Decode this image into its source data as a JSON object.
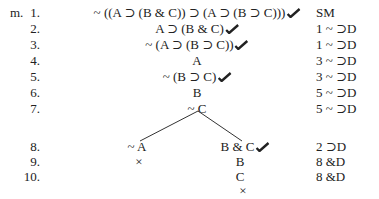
{
  "exercise_label": "m.",
  "rows": [
    {
      "num": "1.",
      "formula": "~ ((A ⊃ (B & C)) ⊃ (A ⊃ (B ⊃ C)))",
      "checked": true,
      "just": "SM"
    },
    {
      "num": "2.",
      "formula": "A ⊃ (B & C)",
      "checked": true,
      "just": "1 ~ ⊃D"
    },
    {
      "num": "3.",
      "formula": "~ (A ⊃ (B ⊃ C))",
      "checked": true,
      "just": "1 ~ ⊃D"
    },
    {
      "num": "4.",
      "formula": "A",
      "checked": false,
      "just": "3 ~ ⊃D"
    },
    {
      "num": "5.",
      "formula": "~ (B ⊃ C)",
      "checked": true,
      "just": "3 ~ ⊃D"
    },
    {
      "num": "6.",
      "formula": "B",
      "checked": false,
      "just": "5 ~ ⊃D"
    },
    {
      "num": "7.",
      "formula": "~ C",
      "checked": false,
      "just": "5 ~ ⊃D"
    }
  ],
  "branch_rows": [
    {
      "num": "8.",
      "left": "~ A",
      "right": "B & C",
      "right_checked": true,
      "just": "2 ⊃D"
    },
    {
      "num": "9.",
      "left": "×",
      "right": "B",
      "just": "8 &D"
    },
    {
      "num": "10.",
      "left": "",
      "right": "C",
      "just": "8 &D"
    }
  ],
  "closed_marker_right": "×"
}
